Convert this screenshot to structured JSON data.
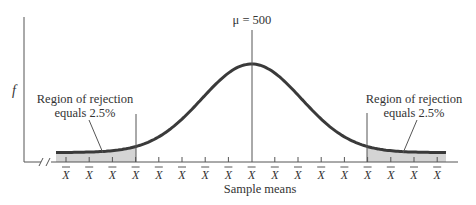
{
  "chart_data": {
    "type": "area",
    "title": "",
    "distribution": "normal",
    "mean_label": "μ = 500",
    "mean": 500,
    "ylabel": "f",
    "xlabel": "Sample means",
    "tick_label": "X̄",
    "tick_count": 17,
    "center_tick_index": 8,
    "rejection_regions": [
      {
        "side": "left",
        "label_line1": "Region of rejection",
        "label_line2": "equals 2.5%",
        "area_pct": 2.5,
        "from_tick": 0,
        "to_tick": 3
      },
      {
        "side": "right",
        "label_line1": "Region of rejection",
        "label_line2": "equals 2.5%",
        "area_pct": 2.5,
        "from_tick": 13,
        "to_tick": 16
      }
    ],
    "axis_break": true,
    "grid": false,
    "colors": {
      "curve": "#3a3a3a",
      "shade": "#d4d4d4",
      "axis": "#555555",
      "text": "#333333"
    }
  },
  "labels": {
    "mu": "μ = 500",
    "f": "f",
    "xaxis": "Sample means",
    "left_region_1": "Region of rejection",
    "left_region_2": "equals 2.5%",
    "right_region_1": "Region of rejection",
    "right_region_2": "equals 2.5%"
  }
}
